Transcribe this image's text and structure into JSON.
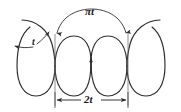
{
  "figure": {
    "type": "engineering-dimension-diagram",
    "background_color": "#ffffff",
    "stroke_color": "#2b2b2b",
    "thin_stroke_color": "#555555",
    "labels": {
      "arc_top": "πt",
      "thickness": "t",
      "pitch": "2t"
    },
    "dimensions": [
      {
        "name": "arc-length-pi-t",
        "label": "πt",
        "position": "top",
        "style": "curved-arc-with-double-arrowheads"
      },
      {
        "name": "thickness-t",
        "label": "t",
        "position": "left",
        "style": "leader-with-double-arrowheads"
      },
      {
        "name": "pitch-2t",
        "label": "2t",
        "position": "bottom",
        "style": "linear-with-double-arrowheads-and-extension-ticks"
      }
    ],
    "geometry": {
      "left_station_x": 55,
      "right_station_x": 128,
      "baseline_y": 100,
      "lobe_radius": 36,
      "wave_count": 2
    }
  }
}
